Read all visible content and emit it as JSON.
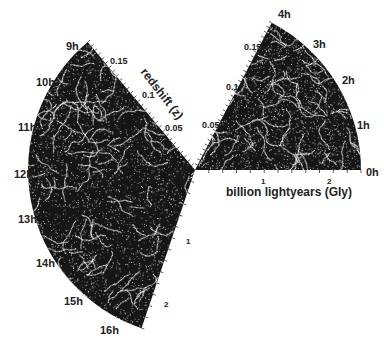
{
  "figure": {
    "colors": {
      "background": "#ffffff",
      "wedge": "#161616",
      "galaxies": "#e8e8e8",
      "text": "#222222"
    }
  },
  "right_wedge": {
    "ra_labels": [
      "0h",
      "1h",
      "2h",
      "3h",
      "4h"
    ],
    "redshift_labels": [
      "0.05",
      "0.1",
      "0.15"
    ],
    "distance_axis_label": "billion lightyears (Gly)",
    "distance_ticks": [
      "1",
      "2"
    ]
  },
  "left_wedge": {
    "ra_labels": [
      "9h",
      "10h",
      "11h",
      "12h",
      "13h",
      "14h",
      "15h",
      "16h"
    ],
    "redshift_axis_label": "redshift (z)",
    "redshift_labels": [
      "0.05",
      "0.1",
      "0.15"
    ],
    "distance_ticks": [
      "1",
      "2"
    ]
  }
}
